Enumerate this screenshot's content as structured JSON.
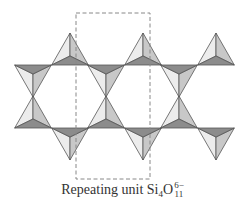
{
  "diagram": {
    "colors": {
      "outline": "#555555",
      "face_dark": "#8c8c8c",
      "face_mid": "#c8c8c8",
      "face_light": "#ececec",
      "dashed_box": "#888888"
    },
    "repeat_box": {
      "x": 76,
      "y": 13,
      "width": 74,
      "height": 166
    },
    "upper_row": {
      "base_y": 65,
      "tetrahedra": [
        {
          "cx": 33,
          "dir": "down"
        },
        {
          "cx": 70,
          "dir": "up"
        },
        {
          "cx": 106,
          "dir": "down"
        },
        {
          "cx": 143,
          "dir": "up"
        },
        {
          "cx": 179,
          "dir": "down"
        },
        {
          "cx": 216,
          "dir": "up"
        }
      ]
    },
    "lower_row": {
      "base_y": 128,
      "tetrahedra": [
        {
          "cx": 33,
          "dir": "up"
        },
        {
          "cx": 70,
          "dir": "down"
        },
        {
          "cx": 106,
          "dir": "up"
        },
        {
          "cx": 143,
          "dir": "down"
        },
        {
          "cx": 179,
          "dir": "up"
        },
        {
          "cx": 216,
          "dir": "down"
        }
      ]
    }
  },
  "caption": {
    "prefix": "Repeating unit Si",
    "si_subscript": "4",
    "o_symbol": "O",
    "o_subscript": "11",
    "charge": "6−"
  }
}
